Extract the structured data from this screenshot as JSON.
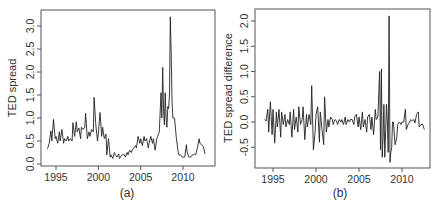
{
  "chart_data": [
    {
      "panel_caption": "(a)",
      "type": "line",
      "title": "",
      "xlabel": "",
      "ylabel": "TED spread",
      "xlim": [
        1993.5,
        2013.5
      ],
      "ylim": [
        0.0,
        3.25
      ],
      "xticks": [
        1995,
        2000,
        2005,
        2010
      ],
      "xtick_labels": [
        "1995",
        "2000",
        "2005",
        "2010"
      ],
      "yticks": [
        0.0,
        0.5,
        1.0,
        1.5,
        2.0,
        2.5,
        3.0
      ],
      "ytick_labels": [
        "0.0",
        "0.5",
        "1.0",
        "1.5",
        "2.0",
        "2.5",
        "3.0"
      ],
      "grid": false,
      "legend": null,
      "series": [
        {
          "name": "TED spread",
          "x": [
            1994.0,
            1994.2,
            1994.4,
            1994.5,
            1994.7,
            1994.9,
            1995.0,
            1995.2,
            1995.4,
            1995.5,
            1995.7,
            1995.9,
            1996.0,
            1996.2,
            1996.4,
            1996.5,
            1996.7,
            1996.9,
            1997.0,
            1997.2,
            1997.4,
            1997.5,
            1997.7,
            1997.9,
            1998.0,
            1998.2,
            1998.4,
            1998.5,
            1998.7,
            1998.9,
            1999.0,
            1999.2,
            1999.4,
            1999.5,
            1999.7,
            1999.9,
            2000.0,
            2000.2,
            2000.4,
            2000.5,
            2000.7,
            2000.9,
            2001.0,
            2001.2,
            2001.4,
            2001.5,
            2001.7,
            2001.9,
            2002.0,
            2002.2,
            2002.4,
            2002.5,
            2002.7,
            2002.9,
            2003.0,
            2003.2,
            2003.4,
            2003.5,
            2003.7,
            2003.9,
            2004.0,
            2004.2,
            2004.4,
            2004.5,
            2004.7,
            2004.9,
            2005.0,
            2005.2,
            2005.4,
            2005.5,
            2005.7,
            2005.9,
            2006.0,
            2006.2,
            2006.4,
            2006.5,
            2006.7,
            2006.9,
            2007.0,
            2007.2,
            2007.4,
            2007.5,
            2007.6,
            2007.7,
            2007.8,
            2007.9,
            2008.0,
            2008.1,
            2008.2,
            2008.3,
            2008.4,
            2008.5,
            2008.6,
            2008.7,
            2008.8,
            2008.9,
            2009.0,
            2009.2,
            2009.4,
            2009.5,
            2009.7,
            2009.9,
            2010.0,
            2010.2,
            2010.4,
            2010.5,
            2010.7,
            2010.9,
            2011.0,
            2011.2,
            2011.4,
            2011.5,
            2011.7,
            2011.9,
            2012.0,
            2012.2,
            2012.4,
            2012.6
          ],
          "y": [
            0.33,
            0.45,
            0.72,
            0.5,
            0.97,
            0.55,
            0.6,
            0.45,
            0.7,
            0.5,
            0.75,
            0.45,
            0.55,
            0.5,
            0.6,
            0.5,
            0.55,
            0.5,
            0.9,
            0.6,
            0.92,
            0.7,
            0.78,
            0.55,
            0.8,
            0.75,
            0.8,
            1.1,
            0.55,
            0.7,
            0.6,
            0.75,
            0.7,
            1.45,
            0.85,
            0.5,
            0.65,
            1.12,
            0.6,
            0.8,
            0.55,
            0.65,
            0.2,
            0.55,
            0.15,
            0.2,
            0.12,
            0.25,
            0.2,
            0.15,
            0.22,
            0.12,
            0.18,
            0.2,
            0.22,
            0.15,
            0.25,
            0.2,
            0.3,
            0.25,
            0.3,
            0.35,
            0.4,
            0.35,
            0.6,
            0.45,
            0.55,
            0.4,
            0.6,
            0.5,
            0.55,
            0.35,
            0.45,
            0.6,
            0.45,
            0.55,
            0.3,
            0.55,
            0.6,
            0.7,
            1.55,
            1.0,
            2.1,
            1.2,
            0.85,
            1.55,
            1.0,
            0.8,
            1.25,
            1.2,
            1.5,
            3.2,
            2.5,
            1.4,
            1.0,
            1.0,
            1.0,
            0.6,
            0.3,
            0.2,
            0.2,
            0.15,
            0.15,
            0.15,
            0.42,
            0.25,
            0.15,
            0.15,
            0.18,
            0.2,
            0.22,
            0.2,
            0.35,
            0.55,
            0.45,
            0.42,
            0.38,
            0.22
          ]
        }
      ]
    },
    {
      "panel_caption": "(b)",
      "type": "line",
      "title": "",
      "xlabel": "",
      "ylabel": "TED spread difference",
      "xlim": [
        1993.5,
        2013.3
      ],
      "ylim": [
        -0.9,
        2.25
      ],
      "xticks": [
        1995,
        2000,
        2005,
        2010
      ],
      "xtick_labels": [
        "1995",
        "2000",
        "2005",
        "2010"
      ],
      "yticks": [
        -0.5,
        0.0,
        0.5,
        1.0,
        1.5,
        2.0
      ],
      "ytick_labels": [
        "-0.5",
        "0.0",
        "0.5",
        "1.0",
        "1.5",
        "2.0"
      ],
      "grid": false,
      "legend": null,
      "series": [
        {
          "name": "TED spread difference",
          "x": [
            1994.0,
            1994.2,
            1994.4,
            1994.5,
            1994.7,
            1994.9,
            1995.0,
            1995.2,
            1995.4,
            1995.5,
            1995.7,
            1995.9,
            1996.0,
            1996.2,
            1996.4,
            1996.5,
            1996.7,
            1996.9,
            1997.0,
            1997.2,
            1997.4,
            1997.5,
            1997.7,
            1997.9,
            1998.0,
            1998.2,
            1998.4,
            1998.5,
            1998.7,
            1998.9,
            1999.0,
            1999.2,
            1999.4,
            1999.5,
            1999.7,
            1999.9,
            2000.0,
            2000.2,
            2000.4,
            2000.5,
            2000.7,
            2000.9,
            2001.0,
            2001.2,
            2001.4,
            2001.5,
            2001.7,
            2001.9,
            2002.0,
            2002.2,
            2002.4,
            2002.5,
            2002.7,
            2002.9,
            2003.0,
            2003.2,
            2003.4,
            2003.5,
            2003.7,
            2003.9,
            2004.0,
            2004.2,
            2004.4,
            2004.5,
            2004.7,
            2004.9,
            2005.0,
            2005.2,
            2005.4,
            2005.5,
            2005.7,
            2005.9,
            2006.0,
            2006.2,
            2006.4,
            2006.5,
            2006.7,
            2006.9,
            2007.0,
            2007.2,
            2007.4,
            2007.5,
            2007.6,
            2007.7,
            2007.8,
            2007.9,
            2008.0,
            2008.1,
            2008.2,
            2008.3,
            2008.4,
            2008.5,
            2008.6,
            2008.7,
            2008.8,
            2008.9,
            2009.0,
            2009.2,
            2009.4,
            2009.5,
            2009.7,
            2009.9,
            2010.0,
            2010.2,
            2010.4,
            2010.5,
            2010.7,
            2010.9,
            2011.0,
            2011.2,
            2011.4,
            2011.5,
            2011.7,
            2011.9,
            2012.0,
            2012.2,
            2012.4,
            2012.6
          ],
          "y": [
            0.05,
            0.02,
            0.25,
            -0.2,
            0.4,
            -0.25,
            0.25,
            -0.42,
            0.2,
            -0.1,
            0.25,
            -0.3,
            0.2,
            -0.05,
            0.15,
            -0.1,
            0.05,
            -0.05,
            0.2,
            -0.3,
            0.25,
            -0.15,
            0.1,
            -0.2,
            0.3,
            -0.05,
            0.05,
            0.3,
            -0.35,
            0.15,
            -0.1,
            0.15,
            -0.05,
            0.72,
            -0.55,
            -0.2,
            0.15,
            0.3,
            -0.4,
            0.2,
            -0.15,
            -0.45,
            0.5,
            -0.2,
            0.05,
            -0.1,
            0.1,
            0.05,
            -0.05,
            0.05,
            0.02,
            -0.05,
            0.05,
            0.0,
            0.05,
            -0.05,
            0.1,
            -0.05,
            0.05,
            0.0,
            0.05,
            0.05,
            -0.05,
            0.1,
            0.15,
            -0.1,
            0.1,
            -0.15,
            0.2,
            -0.1,
            0.05,
            -0.2,
            0.1,
            0.15,
            -0.15,
            0.1,
            -0.25,
            0.25,
            0.05,
            0.1,
            1.0,
            -0.55,
            1.05,
            -0.7,
            -0.3,
            0.35,
            -0.7,
            -0.15,
            0.35,
            0.0,
            -0.6,
            2.1,
            -0.8,
            -0.6,
            -0.5,
            0.0,
            0.0,
            -0.45,
            -0.3,
            -0.05,
            0.0,
            -0.05,
            0.0,
            0.0,
            0.25,
            -0.15,
            -0.05,
            0.0,
            0.05,
            0.02,
            0.05,
            -0.02,
            0.15,
            0.2,
            -0.1,
            -0.05,
            -0.05,
            -0.15
          ]
        }
      ]
    }
  ],
  "captions": {
    "a": "(a)",
    "b": "(b)"
  }
}
